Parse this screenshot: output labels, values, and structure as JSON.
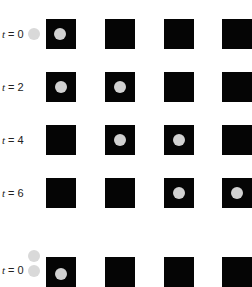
{
  "figure": {
    "colors": {
      "square": "#050505",
      "ball": "#d2d2d2",
      "background": "#ffffff"
    },
    "columns": 4,
    "panels": [
      {
        "rows": [
          {
            "label": "t = 0",
            "ball_column": 0,
            "outside_ball": true
          },
          {
            "label": "t = 2",
            "ball_column": 0,
            "ball_column_2": 1
          },
          {
            "label": "t = 4",
            "ball_column": 1,
            "ball_column_2": 2
          },
          {
            "label": "t = 6",
            "ball_column": 2,
            "ball_column_2": 3
          }
        ]
      },
      {
        "rows": [
          {
            "label": "t = 0",
            "ball_column": 0,
            "outside_balls": 2
          }
        ]
      }
    ]
  },
  "labels": {
    "r0": "t = 0",
    "r1": "t = 2",
    "r2": "t = 4",
    "r3": "t = 6",
    "r4": "t = 0"
  }
}
